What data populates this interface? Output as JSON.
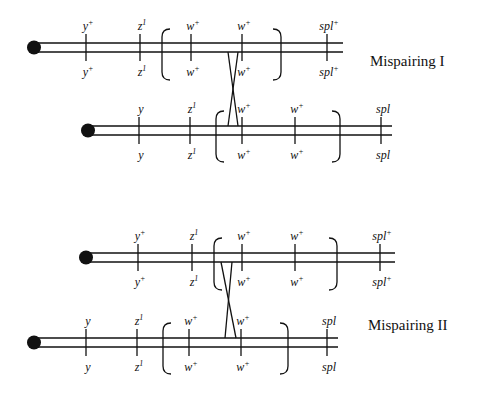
{
  "diagram": {
    "panels": [
      {
        "title": "Mispairing I",
        "title_pos": [
          370,
          66
        ],
        "chromosomes": [
          {
            "centromere": [
              34,
              47.5
            ],
            "line_y": [
              43,
              52
            ],
            "x_end": 343,
            "loci": [
              {
                "x": 86,
                "top": "y",
                "top_sup": "+",
                "bottom": "y",
                "bottom_sup": "+"
              },
              {
                "x": 140,
                "top": "z",
                "top_sup": "1",
                "bottom": "z",
                "bottom_sup": "1"
              },
              {
                "x": 191,
                "top": "w",
                "top_sup": "+",
                "bottom": "w",
                "bottom_sup": "+"
              },
              {
                "x": 242,
                "top": "w",
                "top_sup": "+",
                "bottom": "w",
                "bottom_sup": "+"
              },
              {
                "x": 327,
                "top": "spl",
                "top_sup": "+",
                "bottom": "spl",
                "bottom_sup": "+"
              }
            ],
            "bracket": {
              "left": 162,
              "right": 281,
              "top": 29,
              "bottom": 80
            }
          },
          {
            "centromere": [
              88,
              130.5
            ],
            "line_y": [
              126,
              135
            ],
            "x_end": 392,
            "loci": [
              {
                "x": 139,
                "top": "y",
                "top_sup": "",
                "bottom": "y",
                "bottom_sup": ""
              },
              {
                "x": 190,
                "top": "z",
                "top_sup": "1",
                "bottom": "z",
                "bottom_sup": "1"
              },
              {
                "x": 242,
                "top": "w",
                "top_sup": "+",
                "bottom": "w",
                "bottom_sup": "+"
              },
              {
                "x": 295,
                "top": "w",
                "top_sup": "+",
                "bottom": "w",
                "bottom_sup": "+"
              },
              {
                "x": 381,
                "top": "spl",
                "top_sup": "",
                "bottom": "spl",
                "bottom_sup": ""
              }
            ],
            "bracket": {
              "left": 216,
              "right": 340,
              "top": 111,
              "bottom": 162
            }
          }
        ],
        "crossover": [
          [
            228,
            52,
            238,
            126
          ],
          [
            238,
            52,
            228,
            126
          ]
        ]
      },
      {
        "title": "Mispairing II",
        "title_pos": [
          368,
          330
        ],
        "chromosomes": [
          {
            "centromere": [
              86,
              257.5
            ],
            "line_y": [
              253,
              262
            ],
            "x_end": 395,
            "loci": [
              {
                "x": 138,
                "top": "y",
                "top_sup": "+",
                "bottom": "y",
                "bottom_sup": "+"
              },
              {
                "x": 192,
                "top": "z",
                "top_sup": "1",
                "bottom": "z",
                "bottom_sup": "1"
              },
              {
                "x": 242,
                "top": "w",
                "top_sup": "+",
                "bottom": "w",
                "bottom_sup": "+"
              },
              {
                "x": 295,
                "top": "w",
                "top_sup": "+",
                "bottom": "w",
                "bottom_sup": "+"
              },
              {
                "x": 380,
                "top": "spl",
                "top_sup": "+",
                "bottom": "spl",
                "bottom_sup": "+"
              }
            ],
            "bracket": {
              "left": 214,
              "right": 337,
              "top": 238,
              "bottom": 290
            }
          },
          {
            "centromere": [
              34,
              342.5
            ],
            "line_y": [
              338,
              347
            ],
            "x_end": 338,
            "loci": [
              {
                "x": 86,
                "top": "y",
                "top_sup": "",
                "bottom": "y",
                "bottom_sup": ""
              },
              {
                "x": 137,
                "top": "z",
                "top_sup": "1",
                "bottom": "z",
                "bottom_sup": "1"
              },
              {
                "x": 189,
                "top": "w",
                "top_sup": "+",
                "bottom": "w",
                "bottom_sup": "+"
              },
              {
                "x": 241,
                "top": "w",
                "top_sup": "+",
                "bottom": "w",
                "bottom_sup": "+"
              },
              {
                "x": 327,
                "top": "spl",
                "top_sup": "",
                "bottom": "spl",
                "bottom_sup": ""
              }
            ],
            "bracket": {
              "left": 163,
              "right": 288,
              "top": 323,
              "bottom": 374
            }
          }
        ],
        "crossover": [
          [
            221,
            262,
            236,
            338
          ],
          [
            232,
            262,
            225,
            338
          ]
        ]
      }
    ]
  }
}
